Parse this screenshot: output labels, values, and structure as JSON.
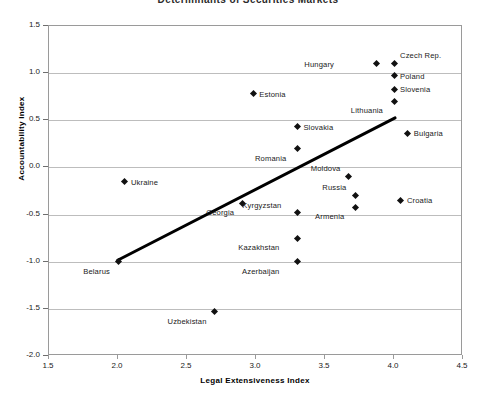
{
  "chart_data": {
    "type": "scatter",
    "title": "Determinants of Securities Markets",
    "xlabel": "Legal Extensiveness Index",
    "ylabel": "Accountability Index",
    "xlim": [
      1.5,
      4.5
    ],
    "ylim": [
      -2.0,
      1.5
    ],
    "xticks": [
      "1.5",
      "2.0",
      "2.5",
      "3.0",
      "3.5",
      "4.0",
      "4.5"
    ],
    "yticks": [
      "1.5",
      "1.0",
      "0.5",
      "0.0",
      "-0.5",
      "-1.0",
      "-1.5",
      "-2.0"
    ],
    "grid": "horizontal",
    "legend": "none",
    "marker": "diamond",
    "marker_color": "#111111",
    "trendline": {
      "label": "fitted-regression-line",
      "color": "#000000",
      "width_px": 3,
      "x_start": 2.0,
      "y_start": -1.0,
      "x_end": 4.02,
      "y_end": 0.52
    },
    "points": [
      {
        "name": "Czech Rep.",
        "x": 4.0,
        "y": 1.1,
        "label_dx": 6,
        "label_dy": -13
      },
      {
        "name": "Hungary",
        "x": 3.87,
        "y": 1.1,
        "label_dx": -40,
        "label_dy": -4
      },
      {
        "name": "Poland",
        "x": 4.0,
        "y": 0.97,
        "label_dx": 6,
        "label_dy": -4
      },
      {
        "name": "Slovenia",
        "x": 4.0,
        "y": 0.83,
        "label_dx": 6,
        "label_dy": -4
      },
      {
        "name": "Lithuania",
        "x": 4.0,
        "y": 0.7,
        "label_dx": -9,
        "label_dy": 5
      },
      {
        "name": "Estonia",
        "x": 2.98,
        "y": 0.78,
        "label_dx": 6,
        "label_dy": -4
      },
      {
        "name": "Slovakia",
        "x": 3.3,
        "y": 0.43,
        "label_dx": 6,
        "label_dy": -4
      },
      {
        "name": "Bulgaria",
        "x": 4.1,
        "y": 0.36,
        "label_dx": 6,
        "label_dy": -4
      },
      {
        "name": "Romania",
        "x": 3.3,
        "y": 0.2,
        "label_dx": -9,
        "label_dy": 5
      },
      {
        "name": "Moldova",
        "x": 3.67,
        "y": -0.1,
        "label_dx": -6,
        "label_dy": -13
      },
      {
        "name": "Ukraine",
        "x": 2.05,
        "y": -0.15,
        "label_dx": 6,
        "label_dy": -4
      },
      {
        "name": "Russia",
        "x": 3.72,
        "y": -0.3,
        "label_dx": -7,
        "label_dy": -13
      },
      {
        "name": "Croatia",
        "x": 4.05,
        "y": -0.35,
        "label_dx": 6,
        "label_dy": -4
      },
      {
        "name": "Armenia",
        "x": 3.72,
        "y": -0.42,
        "label_dx": -9,
        "label_dy": 5
      },
      {
        "name": "Georgia",
        "x": 2.9,
        "y": -0.38,
        "label_dx": -6,
        "label_dy": 5
      },
      {
        "name": "Kyrgyzstan",
        "x": 3.3,
        "y": -0.48,
        "label_dx": -14,
        "label_dy": -12
      },
      {
        "name": "Kazakhstan",
        "x": 3.3,
        "y": -0.75,
        "label_dx": -16,
        "label_dy": 5
      },
      {
        "name": "Azerbaijan",
        "x": 3.3,
        "y": -1.0,
        "label_dx": -16,
        "label_dy": 5
      },
      {
        "name": "Belarus",
        "x": 2.0,
        "y": -1.0,
        "label_dx": -6,
        "label_dy": 5
      },
      {
        "name": "Uzbekistan",
        "x": 2.7,
        "y": -1.53,
        "label_dx": -6,
        "label_dy": 5
      }
    ]
  }
}
